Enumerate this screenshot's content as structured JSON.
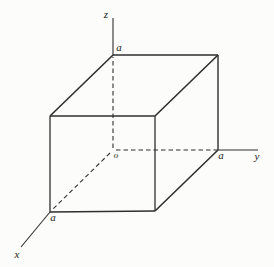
{
  "figure": {
    "width": 274,
    "height": 267,
    "background_color": "#fcfcfa",
    "line_color": "#2f2f2f",
    "text_color": "#222222",
    "dash_pattern": "4.5 3"
  },
  "diagram": {
    "type": "isometric-cube",
    "solid_edges": [
      {
        "name": "edge-top-back",
        "x1": 113,
        "y1": 55,
        "x2": 218,
        "y2": 55,
        "w": 1.6
      },
      {
        "name": "edge-top-left",
        "x1": 113,
        "y1": 55,
        "x2": 50,
        "y2": 116,
        "w": 1.6
      },
      {
        "name": "edge-top-right",
        "x1": 218,
        "y1": 55,
        "x2": 155,
        "y2": 116,
        "w": 1.6
      },
      {
        "name": "edge-front-top",
        "x1": 50,
        "y1": 116,
        "x2": 155,
        "y2": 116,
        "w": 1.3
      },
      {
        "name": "edge-front-left",
        "x1": 50,
        "y1": 116,
        "x2": 50,
        "y2": 212,
        "w": 1.3
      },
      {
        "name": "edge-front-right",
        "x1": 155,
        "y1": 116,
        "x2": 155,
        "y2": 211,
        "w": 1.3
      },
      {
        "name": "edge-back-right",
        "x1": 218,
        "y1": 55,
        "x2": 218,
        "y2": 150,
        "w": 1.4
      },
      {
        "name": "edge-bottom-right",
        "x1": 218,
        "y1": 150,
        "x2": 155,
        "y2": 211,
        "w": 1.6
      },
      {
        "name": "edge-front-bottom",
        "x1": 50,
        "y1": 212,
        "x2": 155,
        "y2": 211,
        "w": 1.6
      }
    ],
    "hidden_edges": [
      {
        "name": "hidden-edge-origin-vertical",
        "x1": 113,
        "y1": 148,
        "x2": 113,
        "y2": 57,
        "w": 1.1
      },
      {
        "name": "hidden-edge-origin-horizontal",
        "x1": 116,
        "y1": 150,
        "x2": 217,
        "y2": 150,
        "w": 1.1
      },
      {
        "name": "hidden-edge-origin-diagonal",
        "x1": 110,
        "y1": 153,
        "x2": 51,
        "y2": 211,
        "w": 1.1
      }
    ],
    "axes": [
      {
        "name": "z-axis",
        "x1": 113,
        "y1": 18,
        "x2": 113,
        "y2": 55,
        "w": 1.1
      },
      {
        "name": "y-axis",
        "x1": 218,
        "y1": 150,
        "x2": 258,
        "y2": 150,
        "w": 1.1
      },
      {
        "name": "x-axis",
        "x1": 50,
        "y1": 212,
        "x2": 21,
        "y2": 247,
        "w": 1.1
      }
    ],
    "labels": [
      {
        "name": "z-axis-label",
        "text": "z",
        "x": 106,
        "y": 18,
        "size": 11
      },
      {
        "name": "edge-length-top-label",
        "text": "a",
        "x": 119,
        "y": 51,
        "size": 11
      },
      {
        "name": "origin-label",
        "text": "o",
        "x": 116,
        "y": 158,
        "size": 9
      },
      {
        "name": "edge-length-right-label",
        "text": "a",
        "x": 221,
        "y": 159,
        "size": 11
      },
      {
        "name": "y-axis-label",
        "text": "y",
        "x": 257,
        "y": 160,
        "size": 11
      },
      {
        "name": "edge-length-front-label",
        "text": "a",
        "x": 53,
        "y": 221,
        "size": 11
      },
      {
        "name": "x-axis-label",
        "text": "x",
        "x": 17,
        "y": 258,
        "size": 11
      }
    ]
  }
}
